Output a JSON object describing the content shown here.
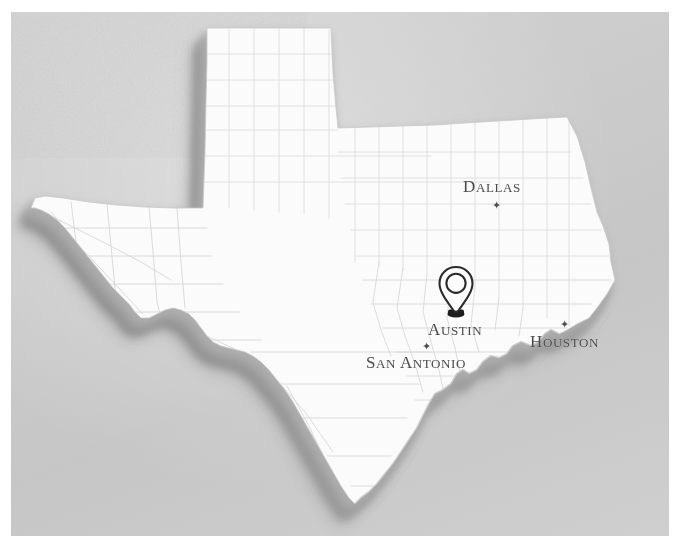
{
  "map": {
    "title": "Texas state map with marked location",
    "region": "Texas",
    "style": "photographed paper map with shaded 3D relief extrusion",
    "background_color": "#cccccc",
    "land_color": "#fbfbfb",
    "border_shadow_color": "#9d9d9d",
    "county_line_color": "#d8d8d8",
    "label_color": "#4a4a4a",
    "pin": {
      "name": "location-pin",
      "label": "Austin",
      "outline_color": "#2b2b2b",
      "fill_color": "#fdfdfd",
      "base_color": "#1f1f1f"
    },
    "cities": [
      {
        "name": "Dallas",
        "first_letter": "D",
        "rest": "ALLAS",
        "marker": "star",
        "marker_glyph": "✦",
        "marker_position": "below-label"
      },
      {
        "name": "Austin",
        "first_letter": "A",
        "rest": "USTIN",
        "marker": "pin",
        "marker_glyph": "✦",
        "marker_position": "above-label"
      },
      {
        "name": "San Antonio",
        "first_letter_1": "S",
        "rest_1": "AN",
        "first_letter_2": "A",
        "rest_2": "NTONIO",
        "marker": "star",
        "marker_glyph": "✦",
        "marker_position": "above-label"
      },
      {
        "name": "Houston",
        "first_letter": "H",
        "rest": "OUSTON",
        "marker": "star",
        "marker_glyph": "✦",
        "marker_position": "above-label"
      }
    ]
  }
}
